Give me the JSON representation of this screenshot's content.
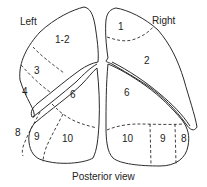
{
  "diagram": {
    "caption": "Posterior view",
    "left_lung": {
      "side_label": "Left",
      "segments": [
        "1-2",
        "3",
        "4",
        "6",
        "8",
        "9",
        "10"
      ]
    },
    "right_lung": {
      "side_label": "Right",
      "segments": [
        "1",
        "2",
        "6",
        "10",
        "9",
        "8"
      ]
    },
    "colors": {
      "line": "#2b2b2b",
      "background": "#ffffff"
    }
  }
}
